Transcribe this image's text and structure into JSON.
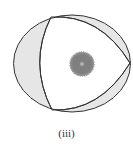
{
  "figure": {
    "caption": "(iii)",
    "colors": {
      "outline": "#333333",
      "shade": "#e6e6e6",
      "background": "#ffffff",
      "center_gear": "#8a8a8a",
      "center_dot": "#b0b0b0"
    },
    "elements": {
      "outer_ellipse": "Ellipse boundary",
      "inner_curved_triangle": "Curved triangle inscribed in ellipse",
      "shaded_regions": "Gray crescent regions between ellipse and triangle",
      "center_body": "Gray gear-like disc at center"
    }
  }
}
